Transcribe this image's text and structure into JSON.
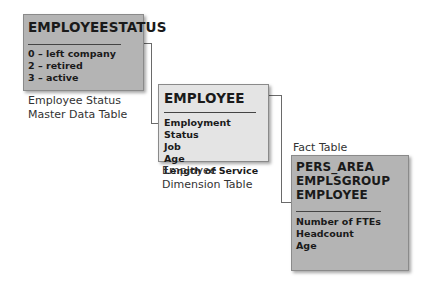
{
  "diagram": {
    "employee_status_table": {
      "title": "EMPLOYEESTATUS",
      "items": [
        "0 – left company",
        "2 – retired",
        "3 – active"
      ],
      "caption_line1": "Employee Status",
      "caption_line2": "Master Data Table"
    },
    "employee_table": {
      "title": "EMPLOYEE",
      "items": [
        "Employment Status",
        "Job",
        "Age",
        "Length of Service"
      ],
      "caption_line1": "Employee",
      "caption_line2": "Dimension Table"
    },
    "fact_table": {
      "label": "Fact Table",
      "keys": [
        "PERS_AREA",
        "EMPLSGROUP",
        "EMPLOYEE"
      ],
      "items": [
        "Number of FTEs",
        "Headcount",
        "Age"
      ]
    }
  }
}
